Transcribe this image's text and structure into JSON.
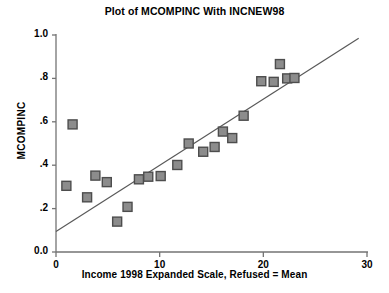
{
  "chart_data": {
    "type": "scatter",
    "title": "Plot of MCOMPINC With INCNEW98",
    "xlabel": "Income 1998 Expanded Scale, Refused = Mean",
    "ylabel": "MCOMPINC",
    "xlim": [
      0,
      30
    ],
    "ylim": [
      0.0,
      1.0
    ],
    "xticks": [
      0,
      10,
      20,
      30
    ],
    "xtick_labels": [
      "0",
      "10",
      "20",
      "30"
    ],
    "yticks": [
      0.0,
      0.2,
      0.4,
      0.6,
      0.8,
      1.0
    ],
    "ytick_labels": [
      "0.0",
      ".2",
      ".4",
      ".6",
      ".8",
      "1.0"
    ],
    "grid": false,
    "legend": null,
    "marker": "square",
    "marker_color": "#8c8c8c",
    "marker_edge_color": "#4d4d4d",
    "line_color": "#595959",
    "axis_color": "#737373",
    "points": [
      {
        "x": 1.0,
        "y": 0.305
      },
      {
        "x": 1.6,
        "y": 0.588
      },
      {
        "x": 3.0,
        "y": 0.252
      },
      {
        "x": 3.8,
        "y": 0.352
      },
      {
        "x": 4.9,
        "y": 0.322
      },
      {
        "x": 5.9,
        "y": 0.14
      },
      {
        "x": 6.9,
        "y": 0.208
      },
      {
        "x": 8.0,
        "y": 0.335
      },
      {
        "x": 8.9,
        "y": 0.347
      },
      {
        "x": 10.1,
        "y": 0.35
      },
      {
        "x": 11.7,
        "y": 0.401
      },
      {
        "x": 12.8,
        "y": 0.5
      },
      {
        "x": 14.2,
        "y": 0.462
      },
      {
        "x": 15.3,
        "y": 0.484
      },
      {
        "x": 16.1,
        "y": 0.555
      },
      {
        "x": 17.0,
        "y": 0.525
      },
      {
        "x": 18.1,
        "y": 0.628
      },
      {
        "x": 19.8,
        "y": 0.787
      },
      {
        "x": 21.0,
        "y": 0.784
      },
      {
        "x": 21.6,
        "y": 0.866
      },
      {
        "x": 22.3,
        "y": 0.8
      },
      {
        "x": 23.0,
        "y": 0.802
      }
    ],
    "fit_line": {
      "x_start": 0.0,
      "y_start": 0.095,
      "x_end": 29.2,
      "y_end": 0.985
    }
  }
}
